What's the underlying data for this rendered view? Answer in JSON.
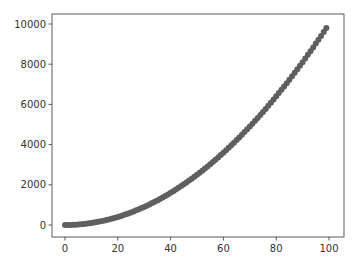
{
  "chart_data": {
    "type": "scatter",
    "title": "",
    "xlabel": "",
    "ylabel": "",
    "xlim": [
      -5,
      105
    ],
    "ylim": [
      -500,
      10500
    ],
    "x_ticks": [
      0,
      20,
      40,
      60,
      80,
      100
    ],
    "y_ticks": [
      0,
      2000,
      4000,
      6000,
      8000,
      10000
    ],
    "grid": false,
    "legend": null,
    "marker_color": "#5f5f5f",
    "marker_size": 3,
    "series": [
      {
        "name": "y = x^2",
        "x": [
          0,
          1,
          2,
          3,
          4,
          5,
          6,
          7,
          8,
          9,
          10,
          11,
          12,
          13,
          14,
          15,
          16,
          17,
          18,
          19,
          20,
          21,
          22,
          23,
          24,
          25,
          26,
          27,
          28,
          29,
          30,
          31,
          32,
          33,
          34,
          35,
          36,
          37,
          38,
          39,
          40,
          41,
          42,
          43,
          44,
          45,
          46,
          47,
          48,
          49,
          50,
          51,
          52,
          53,
          54,
          55,
          56,
          57,
          58,
          59,
          60,
          61,
          62,
          63,
          64,
          65,
          66,
          67,
          68,
          69,
          70,
          71,
          72,
          73,
          74,
          75,
          76,
          77,
          78,
          79,
          80,
          81,
          82,
          83,
          84,
          85,
          86,
          87,
          88,
          89,
          90,
          91,
          92,
          93,
          94,
          95,
          96,
          97,
          98,
          99
        ],
        "y": [
          0,
          1,
          4,
          9,
          16,
          25,
          36,
          49,
          64,
          81,
          100,
          121,
          144,
          169,
          196,
          225,
          256,
          289,
          324,
          361,
          400,
          441,
          484,
          529,
          576,
          625,
          676,
          729,
          784,
          841,
          900,
          961,
          1024,
          1089,
          1156,
          1225,
          1296,
          1369,
          1444,
          1521,
          1600,
          1681,
          1764,
          1849,
          1936,
          2025,
          2116,
          2209,
          2304,
          2401,
          2500,
          2601,
          2704,
          2809,
          2916,
          3025,
          3136,
          3249,
          3364,
          3481,
          3600,
          3721,
          3844,
          3969,
          4096,
          4225,
          4356,
          4489,
          4624,
          4761,
          4900,
          5041,
          5184,
          5329,
          5476,
          5625,
          5776,
          5929,
          6084,
          6241,
          6400,
          6561,
          6724,
          6889,
          7056,
          7225,
          7396,
          7569,
          7744,
          7921,
          8100,
          8281,
          8464,
          8649,
          8836,
          9025,
          9216,
          9409,
          9604,
          9801
        ]
      }
    ]
  },
  "layout": {
    "plot_left": 52,
    "plot_top": 14,
    "plot_right": 344,
    "plot_bottom": 237,
    "x0_px": 65,
    "x_per_unit": 2.64,
    "y0_px": 225,
    "y_per_unit": 0.0201
  }
}
